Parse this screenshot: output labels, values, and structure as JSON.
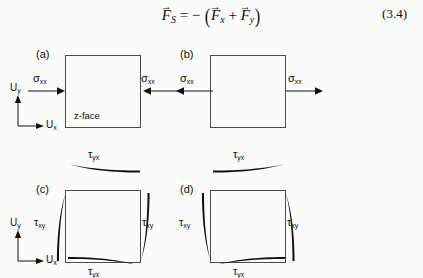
{
  "figure": {
    "equation": {
      "lhs_symbol": "F",
      "lhs_sub": "S",
      "equals": "=",
      "minus": "−",
      "open_paren": "(",
      "term1_symbol": "F",
      "term1_sub": "x",
      "plus": "+",
      "term2_symbol": "F",
      "term2_sub": "y",
      "close_paren": ")",
      "vector_arrow": "→",
      "number": "(3.4)"
    },
    "axes": {
      "y_symbol": "U",
      "y_sub": "y",
      "x_symbol": "U",
      "x_sub": "x"
    },
    "panels": [
      {
        "id": "a",
        "label": "(a)",
        "face_label": "z-face",
        "stress_symbol": "σ",
        "stress_sub": "xx",
        "left_label": "σ",
        "right_label": "σ",
        "arrow_sense": "inward-compression",
        "has_axes": true
      },
      {
        "id": "b",
        "label": "(b)",
        "face_label": "",
        "stress_symbol": "σ",
        "stress_sub": "xx",
        "left_label": "σ",
        "right_label": "σ",
        "arrow_sense": "outward-tension",
        "has_axes": false
      },
      {
        "id": "c",
        "label": "(c)",
        "face_label": "",
        "top_symbol": "τ",
        "top_sub": "yx",
        "bottom_symbol": "τ",
        "bottom_sub": "yx",
        "left_symbol": "τ",
        "left_sub": "xy",
        "right_symbol": "τ",
        "right_sub": "xy",
        "arrow_sense": "top-left bottom-right left-up right-down",
        "has_axes": true
      },
      {
        "id": "d",
        "label": "(d)",
        "face_label": "",
        "top_symbol": "τ",
        "top_sub": "yx",
        "bottom_symbol": "τ",
        "bottom_sub": "yx",
        "left_symbol": "τ",
        "left_sub": "xy",
        "right_symbol": "τ",
        "right_sub": "xy",
        "arrow_sense": "top-right bottom-left left-down right-up",
        "has_axes": false
      }
    ],
    "colors": {
      "ink": "#0d0d0d",
      "box_stroke": "#4a4a4a",
      "background": "#fbfbfa"
    }
  }
}
